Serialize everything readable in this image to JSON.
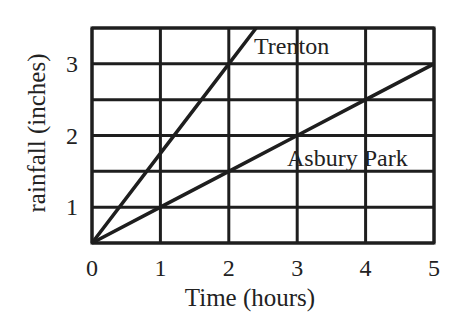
{
  "chart_data": {
    "type": "line",
    "title": "",
    "xlabel": "Time (hours)",
    "ylabel": "rainfall (inches)",
    "xlim": [
      0,
      5
    ],
    "ylim": [
      0.5,
      3.5
    ],
    "x_ticks": [
      0,
      1,
      2,
      3,
      4,
      5
    ],
    "x_tick_labels": [
      "0",
      "1",
      "2",
      "3",
      "4",
      "5"
    ],
    "y_ticks": [
      1,
      2,
      3
    ],
    "y_tick_labels": [
      "1",
      "2",
      "3"
    ],
    "grid": true,
    "grid_x_step": 1,
    "grid_y_step": 0.5,
    "legend": "inline labels",
    "series": [
      {
        "name": "Trenton",
        "x": [
          0,
          1,
          2,
          2.4
        ],
        "y": [
          0.5,
          1.75,
          3.0,
          3.5
        ],
        "slope": 1.25
      },
      {
        "name": "Asbury Park",
        "x": [
          0,
          1,
          2,
          3,
          4,
          5
        ],
        "y": [
          0.5,
          1.0,
          1.5,
          2.0,
          2.5,
          3.0
        ],
        "slope": 0.5
      }
    ]
  },
  "labels": {
    "xlabel": "Time (hours)",
    "ylabel": "rainfall (inches)",
    "series_trenton": "Trenton",
    "series_asbury": "Asbury Park"
  },
  "colors": {
    "ink": "#1e1e1e",
    "background": "#ffffff"
  }
}
